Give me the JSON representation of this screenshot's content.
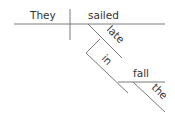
{
  "diagram": {
    "type": "sentence-diagram",
    "sentence": "They sailed late in fall",
    "colors": {
      "line": "#7a7a7a",
      "text": "#333333",
      "background": "#ffffff"
    },
    "words": {
      "subject": "They",
      "verb": "sailed",
      "adverb": "late",
      "preposition": "in",
      "object": "fall",
      "article": "the"
    }
  }
}
